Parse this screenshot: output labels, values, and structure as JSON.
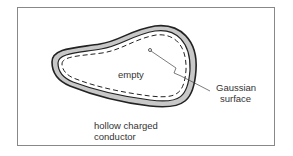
{
  "diagram": {
    "labels": {
      "interior": "empty",
      "gaussian": [
        "Gaussian",
        "surface"
      ],
      "conductor": [
        "hollow charged",
        "conductor"
      ]
    },
    "colors": {
      "shell_fill": "#c8c8c8",
      "outline": "#222222",
      "frame": "#888888"
    }
  }
}
